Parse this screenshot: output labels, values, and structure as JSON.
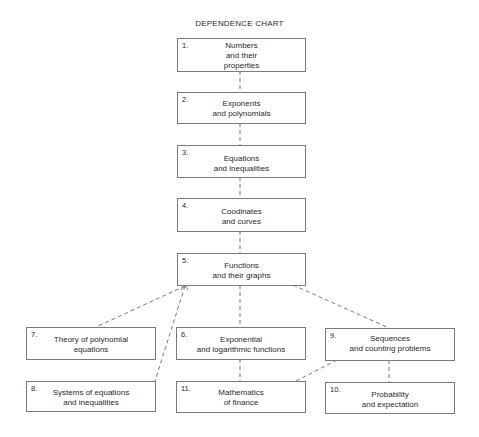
{
  "title": "DEPENDENCE CHART",
  "nodes": [
    {
      "id": "1",
      "number": "1.",
      "label": "Numbers\nand their\nproperties"
    },
    {
      "id": "2",
      "number": "2.",
      "label": "Exponents\nand polynomials"
    },
    {
      "id": "3",
      "number": "3.",
      "label": "Equations\nand inequalities"
    },
    {
      "id": "4",
      "number": "4.",
      "label": "Coodinates\nand curves"
    },
    {
      "id": "5",
      "number": "5.",
      "label": "Functions\nand their graphs"
    },
    {
      "id": "6",
      "number": "6.",
      "label": "Exponential\nand logarithmic functions"
    },
    {
      "id": "7",
      "number": "7.",
      "label": "Theory of polynomial\nequations"
    },
    {
      "id": "8",
      "number": "8.",
      "label": "Systems of equations\nand inequalities"
    },
    {
      "id": "9",
      "number": "9.",
      "label": "Sequences\nand counting problems"
    },
    {
      "id": "10",
      "number": "10.",
      "label": "Probability\nand expectation"
    },
    {
      "id": "11",
      "number": "11.",
      "label": "Mathematics\nof finance"
    }
  ],
  "edges": [
    {
      "from": "1",
      "to": "2",
      "style": "dashed"
    },
    {
      "from": "2",
      "to": "3",
      "style": "dashed"
    },
    {
      "from": "3",
      "to": "4",
      "style": "dashed"
    },
    {
      "from": "4",
      "to": "5",
      "style": "dashed"
    },
    {
      "from": "5",
      "to": "6",
      "style": "dashed"
    },
    {
      "from": "5",
      "to": "7",
      "style": "dashed"
    },
    {
      "from": "5",
      "to": "8",
      "style": "dashed"
    },
    {
      "from": "5",
      "to": "9",
      "style": "dashed"
    },
    {
      "from": "6",
      "to": "11",
      "style": "dashed"
    },
    {
      "from": "9",
      "to": "11",
      "style": "dashed"
    },
    {
      "from": "9",
      "to": "10",
      "style": "dashed"
    }
  ],
  "colors": {
    "border": "#7a7a7a",
    "line": "#6a6a6a",
    "text": "#2a2a2a"
  }
}
